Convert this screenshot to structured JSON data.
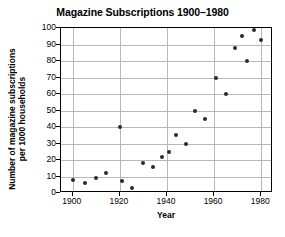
{
  "chart_data": {
    "type": "scatter",
    "title": "Magazine Subscriptions 1900–1980",
    "xlabel": "Year",
    "ylabel": "Number of magazine subscriptions per 1000 households",
    "xlim": [
      1895,
      1985
    ],
    "ylim": [
      0,
      100
    ],
    "grid": true,
    "legend": null,
    "xticks": [
      1900,
      1920,
      1940,
      1960,
      1980
    ],
    "xtick_labels": [
      "1900",
      "1920",
      "1940",
      "1960",
      "1980"
    ],
    "yticks": [
      0,
      10,
      20,
      30,
      40,
      50,
      60,
      70,
      80,
      90,
      100
    ],
    "ytick_labels": [
      "0",
      "10",
      "20",
      "30",
      "40",
      "50",
      "60",
      "70",
      "80",
      "90",
      "100"
    ],
    "marker": "filled-circle",
    "marker_color": "#2b2b2b",
    "points": [
      {
        "x": 1900,
        "y": 8
      },
      {
        "x": 1905,
        "y": 6
      },
      {
        "x": 1910,
        "y": 9
      },
      {
        "x": 1914,
        "y": 12
      },
      {
        "x": 1920,
        "y": 40
      },
      {
        "x": 1921,
        "y": 7
      },
      {
        "x": 1925,
        "y": 3
      },
      {
        "x": 1930,
        "y": 18
      },
      {
        "x": 1934,
        "y": 16
      },
      {
        "x": 1938,
        "y": 22
      },
      {
        "x": 1941,
        "y": 25
      },
      {
        "x": 1944,
        "y": 35
      },
      {
        "x": 1948,
        "y": 30
      },
      {
        "x": 1952,
        "y": 50
      },
      {
        "x": 1956,
        "y": 45
      },
      {
        "x": 1961,
        "y": 70
      },
      {
        "x": 1965,
        "y": 60
      },
      {
        "x": 1969,
        "y": 88
      },
      {
        "x": 1972,
        "y": 95
      },
      {
        "x": 1974,
        "y": 80
      },
      {
        "x": 1977,
        "y": 99
      },
      {
        "x": 1980,
        "y": 93
      }
    ]
  },
  "figure": {
    "background_color": "#ffffff",
    "axis_color": "#000000",
    "grid_color": "#b8b8b8"
  }
}
